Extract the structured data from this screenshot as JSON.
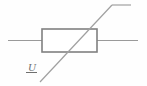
{
  "figure": {
    "name": "potentiometer-circuit-symbol",
    "title": "Variable resistor (potentiometer) with voltage label U",
    "background_color": "#fefefe",
    "width": 147,
    "height": 86
  },
  "colors": {
    "body_stroke": "#808080",
    "body_fill": "#ffffff",
    "lead_stroke": "#9a9a9a",
    "slider_stroke": "#a0a0a0",
    "label_color": "#6f6f6f",
    "underline_color": "#6f6f6f"
  },
  "components": {
    "resistor_body": {
      "label": "resistor-body",
      "x": 42,
      "y": 29,
      "width": 55,
      "height": 23,
      "stroke_width": 1.6
    },
    "left_lead": {
      "label": "left-terminal-lead",
      "x1": 8,
      "y1": 40.5,
      "x2": 42,
      "y2": 40.5,
      "stroke_width": 1.1
    },
    "right_lead": {
      "label": "right-terminal-lead",
      "x1": 97,
      "y1": 40.5,
      "x2": 138,
      "y2": 40.5,
      "stroke_width": 1.1
    },
    "slider_diagonal": {
      "label": "slider-wiper-diagonal",
      "x1": 40,
      "y1": 82,
      "x2": 112,
      "y2": 5,
      "stroke_width": 1.2
    },
    "slider_tail": {
      "label": "slider-top-horizontal-tail",
      "x1": 112,
      "y1": 5,
      "x2": 131,
      "y2": 5,
      "stroke_width": 1.2
    },
    "label_underline": {
      "label": "label-underline",
      "x1": 26,
      "y1": 72.5,
      "x2": 37,
      "y2": 72.5,
      "stroke_width": 1.0
    }
  },
  "annotations": {
    "voltage_label": {
      "text": "U",
      "x": 28,
      "y": 71
    }
  }
}
